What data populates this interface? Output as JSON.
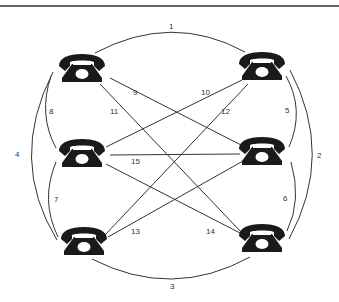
{
  "diagram": {
    "type": "complete-graph",
    "nodes": [
      {
        "id": "phone-top-left",
        "icon": "telephone-icon",
        "x": 82,
        "y": 70
      },
      {
        "id": "phone-top-right",
        "icon": "telephone-icon",
        "x": 262,
        "y": 68
      },
      {
        "id": "phone-middle-left",
        "icon": "telephone-icon",
        "x": 82,
        "y": 155
      },
      {
        "id": "phone-middle-right",
        "icon": "telephone-icon",
        "x": 262,
        "y": 153
      },
      {
        "id": "phone-bottom-left",
        "icon": "telephone-icon",
        "x": 84,
        "y": 243
      },
      {
        "id": "phone-bottom-right",
        "icon": "telephone-icon",
        "x": 262,
        "y": 240
      }
    ],
    "edges": [
      {
        "label": "1",
        "from": "phone-top-left",
        "to": "phone-top-right"
      },
      {
        "label": "2",
        "from": "phone-top-right",
        "to": "phone-bottom-right"
      },
      {
        "label": "3",
        "from": "phone-bottom-left",
        "to": "phone-bottom-right"
      },
      {
        "label": "4",
        "from": "phone-top-left",
        "to": "phone-bottom-left"
      },
      {
        "label": "5",
        "from": "phone-top-right",
        "to": "phone-middle-right"
      },
      {
        "label": "6",
        "from": "phone-middle-right",
        "to": "phone-bottom-right"
      },
      {
        "label": "7",
        "from": "phone-middle-left",
        "to": "phone-bottom-left"
      },
      {
        "label": "8",
        "from": "phone-top-left",
        "to": "phone-middle-left"
      },
      {
        "label": "9",
        "from": "phone-top-left",
        "to": "phone-middle-right"
      },
      {
        "label": "10",
        "from": "phone-top-right",
        "to": "phone-middle-left"
      },
      {
        "label": "11",
        "from": "phone-top-left",
        "to": "phone-bottom-right"
      },
      {
        "label": "12",
        "from": "phone-top-right",
        "to": "phone-bottom-left"
      },
      {
        "label": "13",
        "from": "phone-bottom-left",
        "to": "phone-middle-right"
      },
      {
        "label": "14",
        "from": "phone-middle-left",
        "to": "phone-bottom-right"
      },
      {
        "label": "15",
        "from": "phone-middle-left",
        "to": "phone-middle-right"
      }
    ],
    "labels": {
      "e1": "1",
      "e2": "2",
      "e3": "3",
      "e4": "4",
      "e5": "5",
      "e6": "6",
      "e7": "7",
      "e8": "8",
      "e9": "9",
      "e10": "10",
      "e11": "11",
      "e12": "12",
      "e13": "13",
      "e14": "14",
      "e15": "15"
    }
  }
}
